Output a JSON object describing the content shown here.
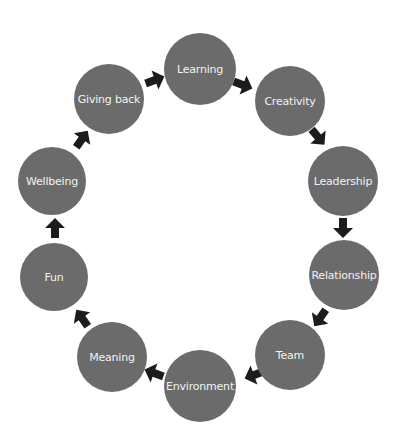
{
  "diagram": {
    "type": "cycle",
    "direction": "clockwise",
    "colors": {
      "node_fill": "#6b6b6b",
      "node_text": "#f2f2f2",
      "arrow_fill": "#1c1c1c",
      "background": "#ffffff"
    },
    "nodes": [
      {
        "label": "Learning",
        "cx": 200,
        "cy": 69,
        "r": 36
      },
      {
        "label": "Creativity",
        "cx": 290,
        "cy": 101,
        "r": 35
      },
      {
        "label": "Leadership",
        "cx": 343,
        "cy": 181,
        "r": 35
      },
      {
        "label": "Relationship",
        "cx": 344,
        "cy": 275,
        "r": 35
      },
      {
        "label": "Team",
        "cx": 290,
        "cy": 355,
        "r": 35
      },
      {
        "label": "Environment",
        "cx": 200,
        "cy": 386,
        "r": 36
      },
      {
        "label": "Meaning",
        "cx": 112,
        "cy": 357,
        "r": 35
      },
      {
        "label": "Fun",
        "cx": 54,
        "cy": 277,
        "r": 34
      },
      {
        "label": "Wellbeing",
        "cx": 52,
        "cy": 181,
        "r": 34
      },
      {
        "label": "Giving back",
        "cx": 109,
        "cy": 99,
        "r": 35
      }
    ],
    "arrows": [
      {
        "from": "Giving back",
        "to": "Learning",
        "x": 155,
        "y": 80,
        "angle": 70
      },
      {
        "from": "Learning",
        "to": "Creativity",
        "x": 243,
        "y": 85,
        "angle": 110
      },
      {
        "from": "Creativity",
        "to": "Leadership",
        "x": 318,
        "y": 137,
        "angle": 140
      },
      {
        "from": "Leadership",
        "to": "Relationship",
        "x": 343,
        "y": 228,
        "angle": 180
      },
      {
        "from": "Relationship",
        "to": "Team",
        "x": 320,
        "y": 318,
        "angle": 215
      },
      {
        "from": "Team",
        "to": "Environment",
        "x": 254,
        "y": 375,
        "angle": 250
      },
      {
        "from": "Environment",
        "to": "Meaning",
        "x": 154,
        "y": 373,
        "angle": 290
      },
      {
        "from": "Meaning",
        "to": "Fun",
        "x": 82,
        "y": 318,
        "angle": 325
      },
      {
        "from": "Fun",
        "to": "Wellbeing",
        "x": 55,
        "y": 228,
        "angle": 0
      },
      {
        "from": "Wellbeing",
        "to": "Giving back",
        "x": 82,
        "y": 139,
        "angle": 35
      }
    ]
  }
}
